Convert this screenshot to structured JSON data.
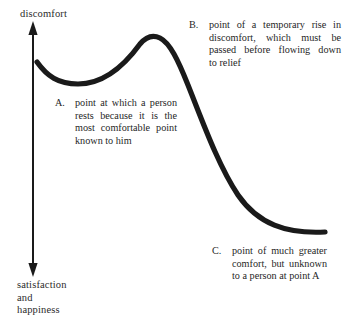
{
  "figure": {
    "type": "diagram",
    "title": "",
    "axis": {
      "orientation": "vertical",
      "arrow_style": "double-headed",
      "top_label": "discomfort",
      "bottom_label": "satisfaction\nand\nhappiness"
    },
    "callouts": [
      {
        "marker": "A.",
        "lines": [
          "point at which a person",
          "rests because it is the",
          "most comfortable point",
          "known to him"
        ],
        "text": "point at which a person rests because it is the most comfortable point known to him"
      },
      {
        "marker": "B.",
        "lines": [
          "point of a temporary rise in",
          "discomfort, which must be",
          "passed before flowing down",
          "to relief"
        ],
        "text": "point of a temporary rise in discomfort, which must be passed before flowing down to relief"
      },
      {
        "marker": "C.",
        "lines": [
          "point of much greater",
          "comfort, but unknown",
          "to a person at point A"
        ],
        "text": "point of much greater comfort, but unknown to a person at point A"
      }
    ],
    "curve": {
      "name": "comfort-curve",
      "color": "#1a1a1a",
      "stroke_width": 5,
      "description": "S-shaped curve: begins mid-height at left, dips to a local minimum (point A), rises to a local maximum (point B), then falls steeply and flattens to a low plateau at right (point C)",
      "key_points": [
        {
          "label": "start",
          "x": 37,
          "y": 62
        },
        {
          "label": "A",
          "x": 78,
          "y": 84
        },
        {
          "label": "B",
          "x": 148,
          "y": 36
        },
        {
          "label": "C",
          "x": 325,
          "y": 232
        }
      ]
    }
  }
}
